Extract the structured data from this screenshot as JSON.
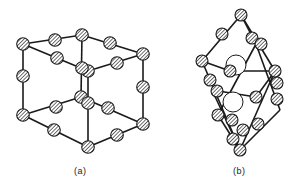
{
  "figure": {
    "panels": [
      {
        "id": "a",
        "label": "(a)",
        "description": "cubic unit cell with hatched atoms at corners and edge midpoints",
        "atoms": [
          [
            23,
            44
          ],
          [
            55,
            40
          ],
          [
            82,
            35
          ],
          [
            110,
            43
          ],
          [
            143,
            54
          ],
          [
            57,
            58
          ],
          [
            88,
            71
          ],
          [
            117,
            63
          ],
          [
            23,
            76
          ],
          [
            143,
            87
          ],
          [
            82,
            68
          ],
          [
            81,
            97
          ],
          [
            88,
            103
          ],
          [
            23,
            115
          ],
          [
            54,
            130
          ],
          [
            88,
            147
          ],
          [
            117,
            135
          ],
          [
            143,
            124
          ],
          [
            56,
            107
          ],
          [
            108,
            108
          ]
        ],
        "bonds": [
          [
            [
              23,
              44
            ],
            [
              82,
              35
            ]
          ],
          [
            [
              82,
              35
            ],
            [
              143,
              54
            ]
          ],
          [
            [
              23,
              44
            ],
            [
              88,
              71
            ]
          ],
          [
            [
              88,
              71
            ],
            [
              143,
              54
            ]
          ],
          [
            [
              23,
              44
            ],
            [
              23,
              115
            ]
          ],
          [
            [
              143,
              54
            ],
            [
              143,
              124
            ]
          ],
          [
            [
              82,
              35
            ],
            [
              81,
              97
            ]
          ],
          [
            [
              88,
              71
            ],
            [
              88,
              147
            ]
          ],
          [
            [
              23,
              115
            ],
            [
              88,
              147
            ]
          ],
          [
            [
              88,
              147
            ],
            [
              143,
              124
            ]
          ],
          [
            [
              23,
              115
            ],
            [
              81,
              97
            ]
          ],
          [
            [
              81,
              97
            ],
            [
              143,
              124
            ]
          ]
        ]
      },
      {
        "id": "b",
        "label": "(b)",
        "description": "rhombohedral primitive cell with hatched atoms and two open interstitial sites",
        "atoms": [
          [
            241,
            15
          ],
          [
            222,
            34
          ],
          [
            252,
            38
          ],
          [
            261,
            44
          ],
          [
            202,
            61
          ],
          [
            210,
            80
          ],
          [
            217,
            91
          ],
          [
            230,
            71
          ],
          [
            275,
            71
          ],
          [
            218,
            115
          ],
          [
            232,
            120
          ],
          [
            243,
            130
          ],
          [
            256,
            97
          ],
          [
            277,
            83
          ],
          [
            277,
            99
          ],
          [
            258,
            124
          ],
          [
            233,
            139
          ],
          [
            240,
            150
          ]
        ],
        "open_sites": [
          [
            236,
            65
          ],
          [
            233,
            102
          ]
        ],
        "bonds": [
          [
            [
              241,
              15
            ],
            [
              202,
              61
            ]
          ],
          [
            [
              241,
              15
            ],
            [
              275,
              71
            ]
          ],
          [
            [
              241,
              15
            ],
            [
              256,
              44
            ]
          ],
          [
            [
              202,
              61
            ],
            [
              240,
              150
            ]
          ],
          [
            [
              275,
              71
            ],
            [
              240,
              150
            ]
          ],
          [
            [
              202,
              61
            ],
            [
              230,
              71
            ]
          ],
          [
            [
              230,
              71
            ],
            [
              275,
              71
            ]
          ],
          [
            [
              212,
              90
            ],
            [
              256,
              97
            ]
          ],
          [
            [
              256,
              97
            ],
            [
              275,
              71
            ]
          ],
          [
            [
              212,
              90
            ],
            [
              240,
              150
            ]
          ],
          [
            [
              256,
              44
            ],
            [
              218,
              115
            ]
          ],
          [
            [
              218,
              115
            ],
            [
              240,
              150
            ]
          ],
          [
            [
              256,
              44
            ],
            [
              280,
              110
            ]
          ],
          [
            [
              280,
              110
            ],
            [
              240,
              150
            ]
          ]
        ]
      }
    ]
  }
}
